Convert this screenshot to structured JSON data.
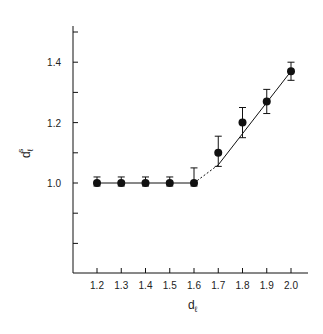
{
  "chart_data": {
    "type": "scatter",
    "title": "",
    "xlabel": "d_ℓ",
    "ylabel": "d_ℓ^s",
    "xlabel_main": "d",
    "xlabel_sub": "ℓ",
    "ylabel_main": "d",
    "ylabel_sub": "ℓ",
    "ylabel_sup": "s",
    "xlim": [
      1.1,
      2.08
    ],
    "ylim": [
      0.7,
      1.55
    ],
    "grid": false,
    "legend": null,
    "x_ticks": [
      1.2,
      1.3,
      1.4,
      1.5,
      1.6,
      1.7,
      1.8,
      1.9,
      2.0
    ],
    "x_tick_labels": [
      "1.2",
      "1.3",
      "1.4",
      "1.5",
      "1.6",
      "1.7",
      "1.8",
      "1.9",
      "2.0"
    ],
    "y_ticks": [
      0.8,
      0.9,
      1.0,
      1.1,
      1.2,
      1.3,
      1.4,
      1.5
    ],
    "y_tick_labels": [
      "",
      "",
      "1.0",
      "",
      "1.2",
      "",
      "1.4",
      ""
    ],
    "series": [
      {
        "name": "measured",
        "marker": "filled-circle",
        "x": [
          1.2,
          1.3,
          1.4,
          1.5,
          1.6,
          1.7,
          1.8,
          1.9,
          2.0
        ],
        "y": [
          1.0,
          1.0,
          1.0,
          1.0,
          1.0,
          1.1,
          1.2,
          1.27,
          1.37
        ],
        "err_upper": [
          1.02,
          1.02,
          1.02,
          1.02,
          1.05,
          1.155,
          1.25,
          1.31,
          1.4
        ],
        "err_lower": [
          0.99,
          0.99,
          0.99,
          0.99,
          0.99,
          1.055,
          1.15,
          1.23,
          1.34
        ]
      }
    ],
    "lines": [
      {
        "name": "plateau",
        "style": "solid",
        "x": [
          1.2,
          1.6
        ],
        "y": [
          1.0,
          1.0
        ]
      },
      {
        "name": "crossover",
        "style": "dotted",
        "x": [
          1.6,
          1.7
        ],
        "y": [
          1.0,
          1.06
        ]
      },
      {
        "name": "linear-fit",
        "style": "solid",
        "x": [
          1.7,
          2.0
        ],
        "y": [
          1.06,
          1.37
        ]
      }
    ]
  },
  "colors": {
    "ink": "#111111",
    "background": "#ffffff"
  }
}
